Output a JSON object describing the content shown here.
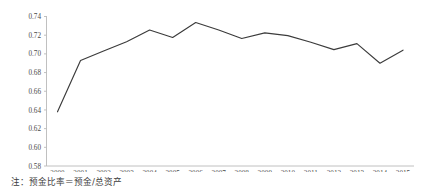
{
  "chart_data": {
    "type": "line",
    "title": "",
    "xlabel": "",
    "ylabel": "",
    "categories": [
      "2000",
      "2001",
      "2002",
      "2003",
      "2004",
      "2005",
      "2006",
      "2007",
      "2008",
      "2009",
      "2010",
      "2011",
      "2012",
      "2013",
      "2014",
      "2015"
    ],
    "values": [
      0.638,
      0.693,
      0.703,
      0.713,
      0.7255,
      0.7175,
      0.7335,
      0.7255,
      0.7165,
      0.7225,
      0.7195,
      0.7125,
      0.7045,
      0.711,
      0.69,
      0.704
    ],
    "series": [
      {
        "name": "deposit-ratio",
        "values": [
          0.638,
          0.693,
          0.703,
          0.713,
          0.7255,
          0.7175,
          0.7335,
          0.7255,
          0.7165,
          0.7225,
          0.7195,
          0.7125,
          0.7045,
          0.711,
          0.69,
          0.704
        ],
        "color": "#3b3b3b"
      }
    ],
    "ylim": [
      0.58,
      0.74
    ],
    "yticks": [
      0.58,
      0.6,
      0.62,
      0.64,
      0.66,
      0.68,
      0.7,
      0.72,
      0.74
    ],
    "ytick_labels": [
      "0.58",
      "0.60",
      "0.62",
      "0.64",
      "0.66",
      "0.68",
      "0.70",
      "0.72",
      "0.74"
    ],
    "xtick_labels": [
      "2000",
      "2001",
      "2002",
      "2003",
      "2004",
      "2005",
      "2006",
      "2007",
      "2008",
      "2009",
      "2010",
      "2011",
      "2012",
      "2013",
      "2014",
      "2015"
    ],
    "grid": false,
    "legend": null,
    "legend_position": "none",
    "axis_color": "#b9b9b9",
    "line_color": "#3b3b3b"
  },
  "note": {
    "text": "注：预金比率＝预金/总资产"
  }
}
